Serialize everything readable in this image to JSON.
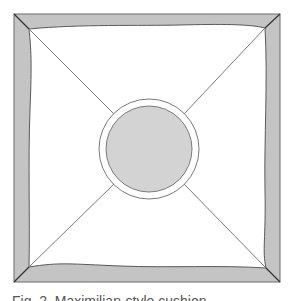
{
  "figure": {
    "colors": {
      "frame_fill": "#c4c4c4",
      "frame_stroke": "#555555",
      "inner_fill": "#ffffff",
      "circle_ring_fill": "#ffffff",
      "circle_fill": "#d3d3d3",
      "line": "#777777"
    },
    "outer_square": {
      "x": 14,
      "y": 14,
      "size": 267
    },
    "circle": {
      "cx": 149,
      "cy": 149,
      "r_outer": 50,
      "r_inner": 43
    }
  },
  "caption": {
    "text": "Fig. 2. Maximilian-style cushion"
  }
}
